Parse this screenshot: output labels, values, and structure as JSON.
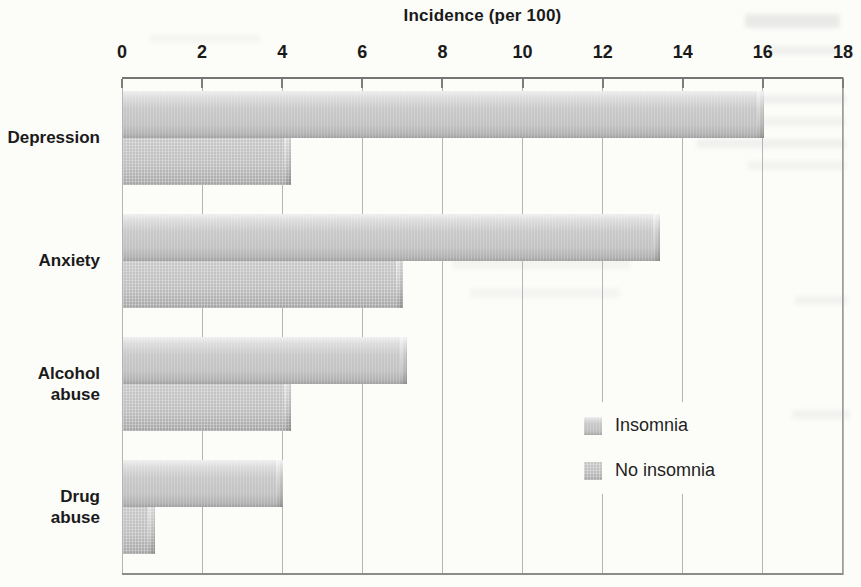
{
  "chart_data": {
    "type": "bar",
    "orientation": "horizontal",
    "title": "Incidence (per 100)",
    "categories": [
      "Depression",
      "Anxiety",
      "Alcohol abuse",
      "Drug abuse"
    ],
    "series": [
      {
        "name": "Insomnia",
        "values": [
          16,
          13.4,
          7.1,
          4
        ],
        "color": "#c5c5c5"
      },
      {
        "name": "No insomnia",
        "values": [
          4.2,
          7,
          4.2,
          0.8
        ],
        "color": "#b8b8b8"
      }
    ],
    "x_axis": {
      "label": "Incidence (per 100)",
      "min": 0,
      "max": 18,
      "tick_step": 2,
      "ticks": [
        0,
        2,
        4,
        6,
        8,
        10,
        12,
        14,
        16,
        18
      ],
      "position": "top"
    },
    "grid": true,
    "legend": {
      "position": "inside bottom-right",
      "entries": [
        "Insomnia",
        "No insomnia"
      ]
    }
  }
}
